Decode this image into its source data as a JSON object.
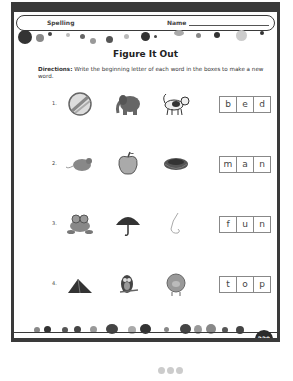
{
  "header": {
    "subject": "Spelling",
    "name_label": "Name"
  },
  "title": "Figure It Out",
  "directions": {
    "label": "Directions:",
    "text": " Write the beginning letter of each word in the boxes to make a new word."
  },
  "rows": [
    {
      "number": "1.",
      "pictures": [
        "ball-icon",
        "elephant-icon",
        "dog-icon"
      ],
      "letters": [
        "b",
        "e",
        "d"
      ]
    },
    {
      "number": "2.",
      "pictures": [
        "mouse-icon",
        "apple-icon",
        "nest-icon"
      ],
      "letters": [
        "m",
        "a",
        "n"
      ]
    },
    {
      "number": "3.",
      "pictures": [
        "frog-icon",
        "umbrella-icon",
        "nose-icon"
      ],
      "letters": [
        "f",
        "u",
        "n"
      ]
    },
    {
      "number": "4.",
      "pictures": [
        "tent-icon",
        "owl-icon",
        "pig-icon"
      ],
      "letters": [
        "t",
        "o",
        "p"
      ]
    }
  ],
  "footer": {
    "book_title": "Crazy Big Book of Second Grade",
    "page_number": "229"
  }
}
